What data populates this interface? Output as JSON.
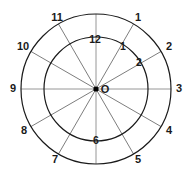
{
  "figure": {
    "type": "geometric-diagram",
    "background_color": "#ffffff"
  },
  "geometry": {
    "center": {
      "x": 96,
      "y": 89,
      "label": "O"
    },
    "outer_circle": {
      "radius": 75,
      "stroke_color": "#1a1a1a",
      "stroke_width": 1.2
    },
    "inner_circle": {
      "radius": 52,
      "stroke_color": "#1a1a1a",
      "stroke_width": 1.2
    },
    "spoke_count": 12,
    "spoke_step_degrees": 30,
    "spoke_stroke_color": "#6e6e6e",
    "spoke_stroke_width": 0.9,
    "axis_stroke_color": "#8a8a8a",
    "center_dot_radius": 2.6,
    "center_dot_color": "#000000"
  },
  "chart_data": {
    "type": "scatter",
    "xlabel": "",
    "ylabel": "",
    "grid": false,
    "legend": null,
    "series": [
      {
        "name": "outer_ring_labels",
        "description": "Hour numbers placed just outside the outer circle",
        "radius": 84,
        "points": [
          {
            "label": "12",
            "hour": 12,
            "angle_deg": 90,
            "x": 96,
            "y": 5,
            "shown": false
          },
          {
            "label": "1",
            "hour": 1,
            "angle_deg": 60,
            "x": 138,
            "y": 18
          },
          {
            "label": "2",
            "hour": 2,
            "angle_deg": 30,
            "x": 169,
            "y": 47
          },
          {
            "label": "3",
            "hour": 3,
            "angle_deg": 0,
            "x": 179,
            "y": 89
          },
          {
            "label": "4",
            "hour": 4,
            "angle_deg": -30,
            "x": 169,
            "y": 131
          },
          {
            "label": "5",
            "hour": 5,
            "angle_deg": -60,
            "x": 138,
            "y": 160
          },
          {
            "label": "6",
            "hour": 6,
            "angle_deg": -90,
            "x": 96,
            "y": 172,
            "shown": false
          },
          {
            "label": "7",
            "hour": 7,
            "angle_deg": -120,
            "x": 55,
            "y": 160
          },
          {
            "label": "8",
            "hour": 8,
            "angle_deg": -150,
            "x": 24,
            "y": 131
          },
          {
            "label": "9",
            "hour": 9,
            "angle_deg": 180,
            "x": 13,
            "y": 89
          },
          {
            "label": "10",
            "hour": 10,
            "angle_deg": 150,
            "x": 23,
            "y": 47
          },
          {
            "label": "11",
            "hour": 11,
            "angle_deg": 120,
            "x": 57,
            "y": 18
          }
        ]
      },
      {
        "name": "inner_ring_labels",
        "description": "Hour numbers placed just inside the inner circle",
        "radius": 40,
        "points": [
          {
            "label": "12",
            "hour": 12,
            "angle_deg": 90,
            "x": 95,
            "y": 40
          },
          {
            "label": "1",
            "hour": 1,
            "angle_deg": 60,
            "x": 123,
            "y": 47
          },
          {
            "label": "2",
            "hour": 2,
            "angle_deg": 30,
            "x": 139,
            "y": 63
          },
          {
            "label": "6",
            "hour": 6,
            "angle_deg": -90,
            "x": 96,
            "y": 141
          }
        ]
      }
    ],
    "spokes": [
      {
        "hour": 12,
        "angle_deg": 90
      },
      {
        "hour": 1,
        "angle_deg": 60
      },
      {
        "hour": 2,
        "angle_deg": 30
      },
      {
        "hour": 3,
        "angle_deg": 0
      },
      {
        "hour": 4,
        "angle_deg": -30
      },
      {
        "hour": 5,
        "angle_deg": -60
      },
      {
        "hour": 6,
        "angle_deg": -90
      },
      {
        "hour": 7,
        "angle_deg": -120
      },
      {
        "hour": 8,
        "angle_deg": -150
      },
      {
        "hour": 9,
        "angle_deg": 180
      },
      {
        "hour": 10,
        "angle_deg": 150
      },
      {
        "hour": 11,
        "angle_deg": 120
      }
    ]
  },
  "labels": {
    "center": "O",
    "outer": [
      "1",
      "2",
      "3",
      "4",
      "5",
      "7",
      "8",
      "9",
      "10",
      "11"
    ],
    "inner": [
      "12",
      "1",
      "2",
      "6"
    ]
  }
}
